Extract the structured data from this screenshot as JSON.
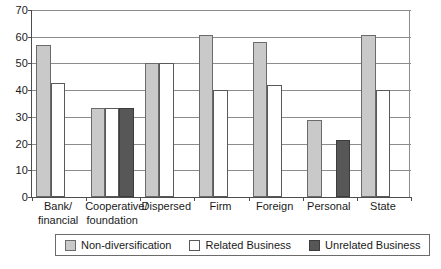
{
  "chart_data": {
    "type": "bar",
    "title": "",
    "subtitle": "",
    "xlabel": "",
    "ylabel": "",
    "ylim": [
      0,
      70
    ],
    "yticks": [
      0,
      10,
      20,
      30,
      40,
      50,
      60,
      70
    ],
    "grid": true,
    "legend_position": "bottom",
    "categories": [
      "Bank/ financial",
      "Cooperative/ foundation",
      "Dispersed",
      "Firm",
      "Foreign",
      "Personal",
      "State"
    ],
    "category_lines": [
      [
        "Bank/",
        "financial"
      ],
      [
        "Cooperative/",
        "foundation"
      ],
      [
        "Dispersed",
        ""
      ],
      [
        "Firm",
        ""
      ],
      [
        "Foreign",
        ""
      ],
      [
        "Personal",
        ""
      ],
      [
        "State",
        ""
      ]
    ],
    "series": [
      {
        "name": "Non-diversification",
        "color": "#c9c9c9",
        "values": [
          57,
          33.3,
          50,
          60.5,
          58,
          28.8,
          60.5
        ]
      },
      {
        "name": "Related Business",
        "color": "#ffffff",
        "values": [
          42.8,
          33.3,
          50,
          40,
          42,
          0,
          40
        ]
      },
      {
        "name": "Unrelated Business",
        "color": "#575757",
        "values": [
          0,
          33.3,
          0,
          0,
          0,
          21.5,
          0
        ]
      }
    ]
  },
  "legend": {
    "items": [
      {
        "label": "Non-diversification",
        "swatch": "s0"
      },
      {
        "label": "Related Business",
        "swatch": "s1"
      },
      {
        "label": "Unrelated Business",
        "swatch": "s2"
      }
    ]
  },
  "colors": {
    "non_diversification": "#c9c9c9",
    "related_business": "#ffffff",
    "unrelated_business": "#575757",
    "axis": "#4d4d4d",
    "grid": "#8c8c8c",
    "background": "#ffffff"
  }
}
